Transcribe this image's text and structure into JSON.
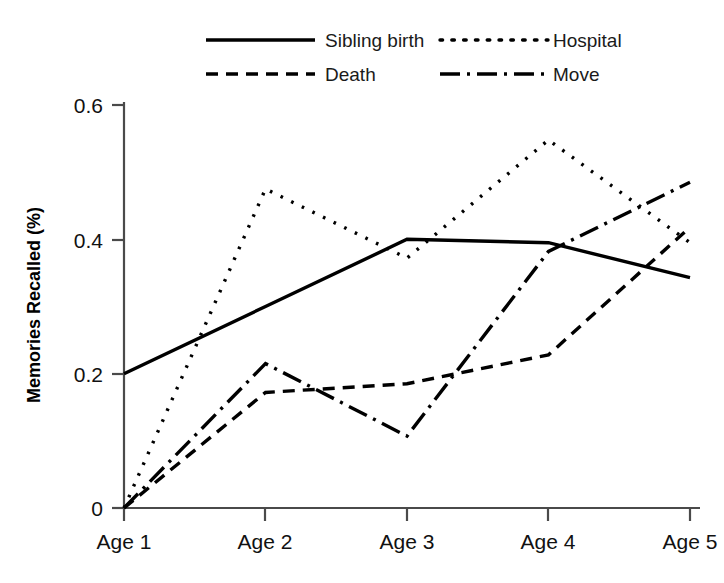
{
  "chart_data": {
    "type": "line",
    "title": "",
    "xlabel": "",
    "ylabel": "Memories Recalled (%)",
    "categories": [
      "Age 1",
      "Age 2",
      "Age 3",
      "Age 4",
      "Age 5"
    ],
    "xticklabels": [
      "Age 1",
      "Age 2",
      "Age 3",
      "Age 4",
      "Age 5"
    ],
    "yticklabels": [
      "0",
      "0.2",
      "0.4",
      "0.6"
    ],
    "ytickvalues": [
      0,
      0.2,
      0.4,
      0.6
    ],
    "ylim": [
      0,
      0.6
    ],
    "grid": false,
    "legend_position": "top",
    "series": [
      {
        "name": "Sibling birth",
        "linestyle": "solid",
        "values": [
          0.2,
          0.3,
          0.4,
          0.395,
          0.343
        ]
      },
      {
        "name": "Hospital",
        "linestyle": "dotted",
        "values": [
          0.0,
          0.475,
          0.372,
          0.548,
          0.395
        ]
      },
      {
        "name": "Death",
        "linestyle": "dashed",
        "values": [
          0.0,
          0.172,
          0.185,
          0.228,
          0.418
        ]
      },
      {
        "name": "Move",
        "linestyle": "dashdot",
        "values": [
          0.0,
          0.215,
          0.107,
          0.382,
          0.485
        ]
      }
    ]
  },
  "legend": {
    "entries": [
      {
        "label": "Sibling birth",
        "style": "solid"
      },
      {
        "label": "Hospital",
        "style": "dotted"
      },
      {
        "label": "Death",
        "style": "dashed"
      },
      {
        "label": "Move",
        "style": "dashdot"
      }
    ]
  },
  "axes": {
    "y_title": "Memories Recalled (%)",
    "y_ticks": [
      "0.6",
      "0.4",
      "0.2",
      "0"
    ],
    "x_ticks": [
      "Age 1",
      "Age 2",
      "Age 3",
      "Age 4",
      "Age 5"
    ]
  },
  "colors": {
    "ink": "#000000",
    "axis": "#4a4a4a",
    "background": "#ffffff"
  }
}
